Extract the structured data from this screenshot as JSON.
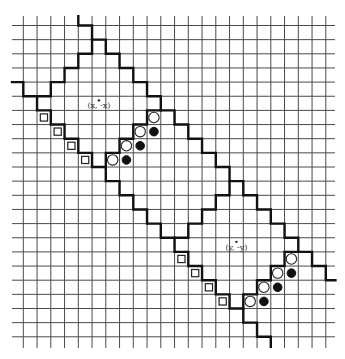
{
  "figure": {
    "grid": {
      "columns": 22,
      "rows": 22,
      "origin_x": 23.3,
      "origin_y": 25.5,
      "cell_w": 13.75,
      "cell_h": 14.15,
      "h_line_extent": [
        12,
        335
      ],
      "v_line_extent": [
        16,
        348
      ],
      "line_color": "#4a4a4a"
    },
    "boundary_color": "#111111",
    "paths": [
      {
        "name": "upper-right-staircase",
        "points": [
          [
            4,
            -0.65
          ],
          [
            4,
            0
          ],
          [
            5,
            0
          ],
          [
            5,
            1
          ],
          [
            6,
            1
          ],
          [
            6,
            2
          ],
          [
            7,
            2
          ],
          [
            7,
            3
          ],
          [
            8,
            3
          ],
          [
            8,
            4
          ],
          [
            9,
            4
          ],
          [
            9,
            5
          ],
          [
            10,
            5
          ],
          [
            10,
            6
          ],
          [
            11,
            6
          ],
          [
            11,
            7
          ],
          [
            12,
            7
          ],
          [
            12,
            8
          ],
          [
            13,
            8
          ],
          [
            13,
            9
          ],
          [
            14,
            9
          ],
          [
            14,
            10
          ],
          [
            15,
            10
          ],
          [
            15,
            11
          ],
          [
            16,
            11
          ],
          [
            16,
            12
          ],
          [
            17,
            12
          ],
          [
            17,
            13
          ],
          [
            18,
            13
          ],
          [
            18,
            14
          ],
          [
            19,
            14
          ],
          [
            19,
            15
          ],
          [
            20,
            15
          ],
          [
            20,
            16
          ],
          [
            21,
            16
          ],
          [
            21,
            17
          ],
          [
            22,
            17
          ],
          [
            22,
            18
          ],
          [
            22.7,
            18
          ]
        ]
      },
      {
        "name": "lower-left-staircase",
        "points": [
          [
            -0.82,
            4
          ],
          [
            0,
            4
          ],
          [
            0,
            5
          ],
          [
            1,
            5
          ],
          [
            1,
            6
          ],
          [
            2,
            6
          ],
          [
            2,
            7
          ],
          [
            3,
            7
          ],
          [
            3,
            8
          ],
          [
            4,
            8
          ],
          [
            4,
            9
          ],
          [
            5,
            9
          ],
          [
            5,
            10
          ],
          [
            6,
            10
          ],
          [
            6,
            11
          ],
          [
            7,
            11
          ],
          [
            7,
            12
          ],
          [
            8,
            12
          ],
          [
            8,
            13
          ],
          [
            9,
            13
          ],
          [
            9,
            14
          ],
          [
            10,
            14
          ],
          [
            10,
            15
          ],
          [
            11,
            15
          ],
          [
            11,
            16
          ],
          [
            12,
            16
          ],
          [
            12,
            17
          ],
          [
            13,
            17
          ],
          [
            13,
            18
          ],
          [
            14,
            18
          ],
          [
            14,
            19
          ],
          [
            15,
            19
          ],
          [
            15,
            20
          ],
          [
            16,
            20
          ],
          [
            16,
            21
          ],
          [
            17,
            21
          ],
          [
            17,
            22
          ],
          [
            18,
            22
          ],
          [
            18,
            22.7
          ]
        ]
      },
      {
        "name": "upper-diamond-upper-left-side",
        "points": [
          [
            5,
            1
          ],
          [
            5,
            2
          ],
          [
            4,
            2
          ],
          [
            4,
            3
          ],
          [
            3,
            3
          ],
          [
            3,
            4
          ],
          [
            2,
            4
          ],
          [
            2,
            5
          ],
          [
            1,
            5
          ]
        ]
      },
      {
        "name": "upper-diamond-lower-right-side",
        "points": [
          [
            10,
            6
          ],
          [
            9,
            6
          ],
          [
            9,
            7
          ],
          [
            8,
            7
          ],
          [
            8,
            8
          ],
          [
            7,
            8
          ],
          [
            7,
            9
          ],
          [
            6,
            9
          ],
          [
            6,
            10
          ]
        ]
      },
      {
        "name": "lower-diamond-upper-left-side",
        "points": [
          [
            15,
            11
          ],
          [
            15,
            12
          ],
          [
            14,
            12
          ],
          [
            14,
            13
          ],
          [
            13,
            13
          ],
          [
            13,
            14
          ],
          [
            12,
            14
          ],
          [
            12,
            15
          ],
          [
            11,
            15
          ]
        ]
      },
      {
        "name": "lower-diamond-lower-right-side",
        "points": [
          [
            20,
            16
          ],
          [
            19,
            16
          ],
          [
            19,
            17
          ],
          [
            18,
            17
          ],
          [
            18,
            18
          ],
          [
            17,
            18
          ],
          [
            17,
            19
          ],
          [
            16,
            19
          ],
          [
            16,
            20
          ]
        ]
      }
    ],
    "square_markers": [
      [
        1,
        6
      ],
      [
        2,
        7
      ],
      [
        3,
        8
      ],
      [
        4,
        9
      ],
      [
        11,
        16
      ],
      [
        12,
        17
      ],
      [
        13,
        18
      ],
      [
        14,
        19
      ]
    ],
    "open_circle_markers": [
      [
        9,
        6
      ],
      [
        8,
        7
      ],
      [
        7,
        8
      ],
      [
        6,
        9
      ],
      [
        19,
        16
      ],
      [
        18,
        17
      ],
      [
        17,
        18
      ],
      [
        16,
        19
      ]
    ],
    "filled_circle_markers": [
      [
        9,
        7
      ],
      [
        8,
        8
      ],
      [
        7,
        9
      ],
      [
        19,
        17
      ],
      [
        18,
        18
      ],
      [
        17,
        19
      ]
    ],
    "points": [
      {
        "label": "(x, -x)",
        "cell": [
          5.5,
          5.5
        ]
      },
      {
        "label": "(y, -y)",
        "cell": [
          15.5,
          15.5
        ]
      }
    ]
  }
}
